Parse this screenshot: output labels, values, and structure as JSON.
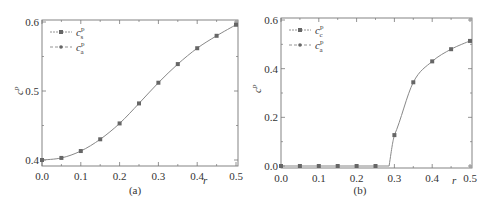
{
  "figure": {
    "panels": [
      "(a)",
      "(b)"
    ]
  },
  "chart_data": [
    {
      "type": "line",
      "panel_label": "(a)",
      "title": "",
      "xlabel": "r",
      "ylabel": "c^p",
      "xlim": [
        0.0,
        0.5
      ],
      "ylim": [
        0.4,
        0.6
      ],
      "xticks": [
        "0.0",
        "0.1",
        "0.2",
        "0.3",
        "0.4",
        "0.5"
      ],
      "yticks": [
        "0.4",
        "0.5",
        "0.6"
      ],
      "grid": false,
      "legend_position": "upper left",
      "legend": [
        "c_s^p",
        "c_a^p"
      ],
      "x": [
        0.0,
        0.05,
        0.1,
        0.15,
        0.2,
        0.25,
        0.3,
        0.35,
        0.4,
        0.45,
        0.5
      ],
      "series": [
        {
          "name": "c_s^p",
          "values": [
            0.4,
            0.403,
            0.413,
            0.43,
            0.453,
            0.482,
            0.512,
            0.539,
            0.562,
            0.58,
            0.596
          ]
        },
        {
          "name": "c_a^p",
          "values": [
            0.4,
            0.403,
            0.413,
            0.43,
            0.453,
            0.482,
            0.512,
            0.539,
            0.562,
            0.58,
            0.596
          ]
        }
      ]
    },
    {
      "type": "line",
      "panel_label": "(b)",
      "title": "",
      "xlabel": "r",
      "ylabel": "c^p",
      "xlim": [
        0.0,
        0.5
      ],
      "ylim": [
        0.0,
        0.6
      ],
      "xticks": [
        "0.0",
        "0.1",
        "0.2",
        "0.3",
        "0.4",
        "0.5"
      ],
      "yticks": [
        "0.0",
        "0.2",
        "0.4",
        "0.6"
      ],
      "grid": false,
      "legend_position": "upper left",
      "legend": [
        "c_c^p",
        "c_a^p"
      ],
      "x": [
        0.0,
        0.05,
        0.1,
        0.15,
        0.2,
        0.25,
        0.3,
        0.35,
        0.4,
        0.45,
        0.5
      ],
      "series": [
        {
          "name": "c_c^p",
          "values": [
            0.0,
            0.0,
            0.0,
            0.0,
            0.0,
            0.0,
            0.127,
            0.344,
            0.43,
            0.48,
            0.514
          ]
        },
        {
          "name": "c_a^p",
          "values": [
            0.0,
            0.0,
            0.0,
            0.0,
            0.0,
            0.0,
            0.127,
            0.344,
            0.43,
            0.48,
            0.514
          ]
        }
      ],
      "annotations": [
        "curve rises from zero near r = 0.286"
      ]
    }
  ]
}
